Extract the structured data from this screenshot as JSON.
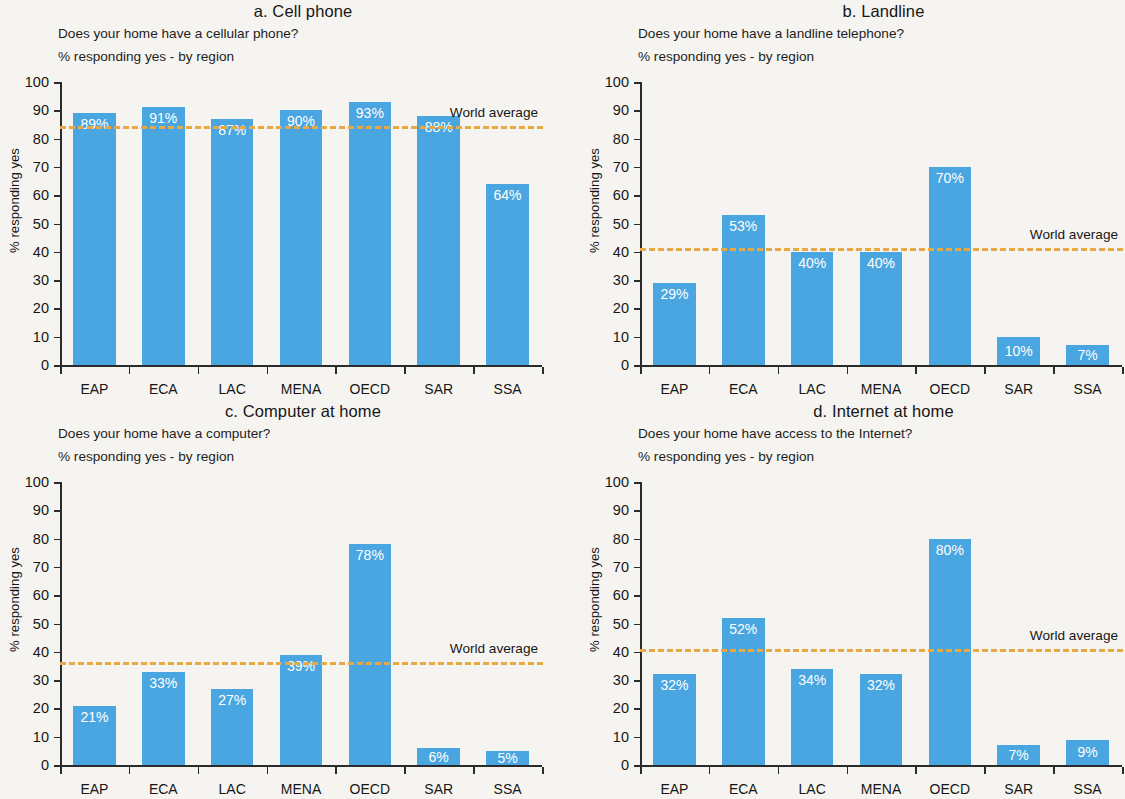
{
  "figure": {
    "axis_title": "% responding yes",
    "world_average_label": "World average",
    "y_ticks": [
      "0",
      "10",
      "20",
      "30",
      "40",
      "50",
      "60",
      "70",
      "80",
      "90",
      "100"
    ],
    "categories": [
      "EAP",
      "ECA",
      "LAC",
      "MENA",
      "OECD",
      "SAR",
      "SSA"
    ]
  },
  "panels": [
    {
      "key": "a",
      "title": "a. Cell phone",
      "subtitle": "Does your home have a cellular phone?",
      "subtitle2": "% responding yes - by region",
      "values": [
        89,
        91,
        87,
        90,
        93,
        88,
        64
      ],
      "labels": [
        "89%",
        "91%",
        "87%",
        "90%",
        "93%",
        "88%",
        "64%"
      ],
      "world_average": 84.5
    },
    {
      "key": "b",
      "title": "b. Landline",
      "subtitle": "Does your home have a landline telephone?",
      "subtitle2": "% responding yes - by region",
      "values": [
        29,
        53,
        40,
        40,
        70,
        10,
        7
      ],
      "labels": [
        "29%",
        "53%",
        "40%",
        "40%",
        "70%",
        "10%",
        "7%"
      ],
      "world_average": 41.5
    },
    {
      "key": "c",
      "title": "c. Computer at home",
      "subtitle": "Does your home have a computer?",
      "subtitle2": "% responding yes - by region",
      "values": [
        21,
        33,
        27,
        39,
        78,
        6,
        5
      ],
      "labels": [
        "21%",
        "33%",
        "27%",
        "39%",
        "78%",
        "6%",
        "5%"
      ],
      "world_average": 36.5
    },
    {
      "key": "d",
      "title": "d. Internet at home",
      "subtitle": "Does your home have access to the Internet?",
      "subtitle2": "% responding yes - by region",
      "values": [
        32,
        52,
        34,
        32,
        80,
        7,
        9
      ],
      "labels": [
        "32%",
        "52%",
        "34%",
        "32%",
        "80%",
        "7%",
        "9%"
      ],
      "world_average": 41.0
    }
  ],
  "chart_data": {
    "type": "bar",
    "xlabel": "",
    "ylabel": "% responding yes",
    "ylim": [
      0,
      100
    ],
    "ytick_step": 10,
    "grid": false,
    "legend": "none",
    "bar_color": "#49a6e0",
    "average_line_color": "#e8a944",
    "categories": [
      "EAP",
      "ECA",
      "LAC",
      "MENA",
      "OECD",
      "SAR",
      "SSA"
    ],
    "panels": [
      {
        "panel": "a",
        "title": "a. Cell phone",
        "question": "Does your home have a cellular phone?",
        "subtitle": "% responding yes - by region",
        "values": [
          89,
          91,
          87,
          90,
          93,
          88,
          64
        ],
        "world_average": 84.5,
        "annotations": [
          "World average"
        ]
      },
      {
        "panel": "b",
        "title": "b. Landline",
        "question": "Does your home have a landline telephone?",
        "subtitle": "% responding yes - by region",
        "values": [
          29,
          53,
          40,
          40,
          70,
          10,
          7
        ],
        "world_average": 41.5,
        "annotations": [
          "World average"
        ]
      },
      {
        "panel": "c",
        "title": "c. Computer at home",
        "question": "Does your home have a computer?",
        "subtitle": "% responding yes - by region",
        "values": [
          21,
          33,
          27,
          39,
          78,
          6,
          5
        ],
        "world_average": 36.5,
        "annotations": [
          "World average"
        ]
      },
      {
        "panel": "d",
        "title": "d. Internet at home",
        "question": "Does your home have access to the Internet?",
        "subtitle": "% responding yes - by region",
        "values": [
          32,
          52,
          34,
          32,
          80,
          7,
          9
        ],
        "world_average": 41.0,
        "annotations": [
          "World average"
        ]
      }
    ]
  }
}
